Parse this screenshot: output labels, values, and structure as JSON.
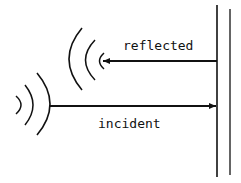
{
  "diagram": {
    "type": "wave-reflection",
    "colors": {
      "ink": "#111111",
      "background": "#ffffff"
    },
    "labels": {
      "reflected": "reflected",
      "incident": "incident"
    },
    "elements": {
      "wall": {
        "name": "reflecting-surface",
        "lines": 2
      },
      "incident_arrow": {
        "direction": "right",
        "label": "incident"
      },
      "reflected_arrow": {
        "direction": "left",
        "label": "reflected"
      },
      "incident_wavefronts": 3,
      "reflected_wavefronts": 3
    }
  }
}
